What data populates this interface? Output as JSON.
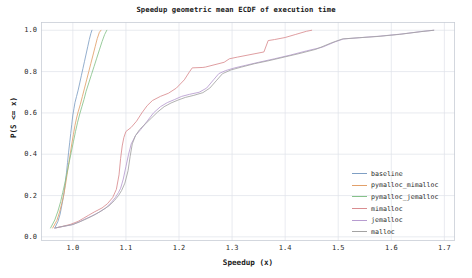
{
  "chart_data": {
    "type": "line",
    "title": "Speedup geometric mean ECDF of execution time",
    "xlabel": "Speedup (x)",
    "ylabel": "P(S <= x)",
    "xlim": [
      0.94,
      1.72
    ],
    "ylim": [
      -0.02,
      1.04
    ],
    "grid": true,
    "legend_position": "lower right",
    "xticks": [
      "1.0",
      "1.1",
      "1.2",
      "1.3",
      "1.4",
      "1.5",
      "1.6",
      "1.7"
    ],
    "xtick_values": [
      1.0,
      1.1,
      1.2,
      1.3,
      1.4,
      1.5,
      1.6,
      1.7
    ],
    "yticks": [
      "0.0",
      "0.2",
      "0.4",
      "0.6",
      "0.8",
      "1.0"
    ],
    "ytick_values": [
      0.0,
      0.2,
      0.4,
      0.6,
      0.8,
      1.0
    ],
    "series": [
      {
        "name": "baseline",
        "color": "#7f9fc4",
        "points": [
          [
            0.966,
            0.043
          ],
          [
            0.972,
            0.075
          ],
          [
            0.976,
            0.11
          ],
          [
            0.979,
            0.15
          ],
          [
            0.982,
            0.19
          ],
          [
            0.984,
            0.225
          ],
          [
            0.986,
            0.265
          ],
          [
            0.988,
            0.31
          ],
          [
            0.99,
            0.36
          ],
          [
            0.992,
            0.41
          ],
          [
            0.994,
            0.455
          ],
          [
            0.996,
            0.5
          ],
          [
            0.998,
            0.545
          ],
          [
            1.0,
            0.59
          ],
          [
            1.002,
            0.62
          ],
          [
            1.004,
            0.65
          ],
          [
            1.007,
            0.68
          ],
          [
            1.01,
            0.71
          ],
          [
            1.013,
            0.745
          ],
          [
            1.016,
            0.78
          ],
          [
            1.019,
            0.815
          ],
          [
            1.022,
            0.85
          ],
          [
            1.025,
            0.885
          ],
          [
            1.028,
            0.92
          ],
          [
            1.031,
            0.955
          ],
          [
            1.034,
            0.985
          ],
          [
            1.036,
            1.0
          ]
        ]
      },
      {
        "name": "pymalloc_mimalloc",
        "color": "#e2a06a",
        "points": [
          [
            0.962,
            0.043
          ],
          [
            0.97,
            0.08
          ],
          [
            0.975,
            0.12
          ],
          [
            0.979,
            0.16
          ],
          [
            0.983,
            0.205
          ],
          [
            0.986,
            0.25
          ],
          [
            0.989,
            0.3
          ],
          [
            0.992,
            0.35
          ],
          [
            0.995,
            0.4
          ],
          [
            0.998,
            0.45
          ],
          [
            1.001,
            0.495
          ],
          [
            1.004,
            0.54
          ],
          [
            1.007,
            0.575
          ],
          [
            1.01,
            0.605
          ],
          [
            1.014,
            0.64
          ],
          [
            1.018,
            0.68
          ],
          [
            1.022,
            0.72
          ],
          [
            1.026,
            0.76
          ],
          [
            1.03,
            0.8
          ],
          [
            1.034,
            0.84
          ],
          [
            1.038,
            0.88
          ],
          [
            1.042,
            0.92
          ],
          [
            1.046,
            0.96
          ],
          [
            1.05,
            0.99
          ],
          [
            1.053,
            1.0
          ]
        ]
      },
      {
        "name": "pymalloc_jemalloc",
        "color": "#86c28a",
        "points": [
          [
            0.958,
            0.043
          ],
          [
            0.966,
            0.082
          ],
          [
            0.972,
            0.125
          ],
          [
            0.977,
            0.17
          ],
          [
            0.981,
            0.215
          ],
          [
            0.985,
            0.26
          ],
          [
            0.989,
            0.31
          ],
          [
            0.993,
            0.36
          ],
          [
            0.997,
            0.41
          ],
          [
            1.001,
            0.46
          ],
          [
            1.005,
            0.51
          ],
          [
            1.009,
            0.555
          ],
          [
            1.013,
            0.595
          ],
          [
            1.017,
            0.63
          ],
          [
            1.021,
            0.665
          ],
          [
            1.025,
            0.705
          ],
          [
            1.03,
            0.745
          ],
          [
            1.035,
            0.785
          ],
          [
            1.04,
            0.825
          ],
          [
            1.045,
            0.865
          ],
          [
            1.05,
            0.905
          ],
          [
            1.055,
            0.945
          ],
          [
            1.06,
            0.98
          ],
          [
            1.064,
            1.0
          ]
        ]
      },
      {
        "name": "mimalloc",
        "color": "#d98d90",
        "points": [
          [
            0.968,
            0.043
          ],
          [
            0.995,
            0.06
          ],
          [
            1.01,
            0.075
          ],
          [
            1.02,
            0.09
          ],
          [
            1.03,
            0.105
          ],
          [
            1.04,
            0.12
          ],
          [
            1.055,
            0.14
          ],
          [
            1.065,
            0.16
          ],
          [
            1.075,
            0.19
          ],
          [
            1.082,
            0.23
          ],
          [
            1.087,
            0.3
          ],
          [
            1.09,
            0.38
          ],
          [
            1.093,
            0.44
          ],
          [
            1.096,
            0.48
          ],
          [
            1.1,
            0.51
          ],
          [
            1.11,
            0.53
          ],
          [
            1.12,
            0.56
          ],
          [
            1.13,
            0.6
          ],
          [
            1.14,
            0.635
          ],
          [
            1.15,
            0.66
          ],
          [
            1.165,
            0.68
          ],
          [
            1.18,
            0.695
          ],
          [
            1.195,
            0.72
          ],
          [
            1.21,
            0.76
          ],
          [
            1.22,
            0.8
          ],
          [
            1.225,
            0.818
          ],
          [
            1.245,
            0.82
          ],
          [
            1.25,
            0.822
          ],
          [
            1.285,
            0.845
          ],
          [
            1.295,
            0.862
          ],
          [
            1.31,
            0.87
          ],
          [
            1.33,
            0.88
          ],
          [
            1.36,
            0.895
          ],
          [
            1.368,
            0.95
          ],
          [
            1.38,
            0.955
          ],
          [
            1.4,
            0.965
          ],
          [
            1.42,
            0.98
          ],
          [
            1.44,
            0.995
          ],
          [
            1.45,
            1.0
          ]
        ]
      },
      {
        "name": "jemalloc",
        "color": "#b79cd0",
        "points": [
          [
            0.966,
            0.043
          ],
          [
            0.998,
            0.058
          ],
          [
            1.012,
            0.072
          ],
          [
            1.022,
            0.085
          ],
          [
            1.035,
            0.1
          ],
          [
            1.05,
            0.12
          ],
          [
            1.062,
            0.14
          ],
          [
            1.072,
            0.165
          ],
          [
            1.08,
            0.19
          ],
          [
            1.086,
            0.215
          ],
          [
            1.09,
            0.235
          ],
          [
            1.095,
            0.28
          ],
          [
            1.1,
            0.34
          ],
          [
            1.105,
            0.4
          ],
          [
            1.11,
            0.45
          ],
          [
            1.118,
            0.49
          ],
          [
            1.128,
            0.52
          ],
          [
            1.14,
            0.56
          ],
          [
            1.152,
            0.6
          ],
          [
            1.165,
            0.63
          ],
          [
            1.178,
            0.65
          ],
          [
            1.192,
            0.665
          ],
          [
            1.205,
            0.68
          ],
          [
            1.22,
            0.69
          ],
          [
            1.238,
            0.7
          ],
          [
            1.252,
            0.72
          ],
          [
            1.265,
            0.76
          ],
          [
            1.275,
            0.79
          ],
          [
            1.288,
            0.805
          ],
          [
            1.305,
            0.818
          ],
          [
            1.325,
            0.83
          ],
          [
            1.35,
            0.845
          ],
          [
            1.38,
            0.862
          ],
          [
            1.41,
            0.88
          ],
          [
            1.44,
            0.9
          ],
          [
            1.47,
            0.918
          ],
          [
            1.495,
            0.945
          ],
          [
            1.51,
            0.958
          ],
          [
            1.545,
            0.965
          ],
          [
            1.58,
            0.972
          ],
          [
            1.62,
            0.982
          ],
          [
            1.66,
            0.995
          ],
          [
            1.68,
            1.0
          ]
        ]
      },
      {
        "name": "malloc",
        "color": "#a3a3a3",
        "points": [
          [
            0.966,
            0.043
          ],
          [
            1.0,
            0.06
          ],
          [
            1.015,
            0.075
          ],
          [
            1.028,
            0.09
          ],
          [
            1.042,
            0.108
          ],
          [
            1.055,
            0.128
          ],
          [
            1.068,
            0.15
          ],
          [
            1.078,
            0.175
          ],
          [
            1.086,
            0.2
          ],
          [
            1.092,
            0.225
          ],
          [
            1.098,
            0.26
          ],
          [
            1.104,
            0.32
          ],
          [
            1.108,
            0.39
          ],
          [
            1.112,
            0.45
          ],
          [
            1.118,
            0.49
          ],
          [
            1.126,
            0.52
          ],
          [
            1.136,
            0.545
          ],
          [
            1.148,
            0.575
          ],
          [
            1.16,
            0.605
          ],
          [
            1.172,
            0.63
          ],
          [
            1.185,
            0.648
          ],
          [
            1.198,
            0.662
          ],
          [
            1.212,
            0.675
          ],
          [
            1.228,
            0.685
          ],
          [
            1.245,
            0.698
          ],
          [
            1.258,
            0.72
          ],
          [
            1.27,
            0.755
          ],
          [
            1.282,
            0.79
          ],
          [
            1.298,
            0.808
          ],
          [
            1.318,
            0.822
          ],
          [
            1.342,
            0.838
          ],
          [
            1.368,
            0.852
          ],
          [
            1.398,
            0.87
          ],
          [
            1.428,
            0.888
          ],
          [
            1.458,
            0.908
          ],
          [
            1.488,
            0.94
          ],
          [
            1.508,
            0.958
          ],
          [
            1.54,
            0.964
          ],
          [
            1.575,
            0.97
          ],
          [
            1.615,
            0.98
          ],
          [
            1.655,
            0.993
          ],
          [
            1.68,
            1.0
          ]
        ]
      }
    ]
  },
  "legend": {
    "items": [
      {
        "label": "baseline"
      },
      {
        "label": "pymalloc_mimalloc"
      },
      {
        "label": "pymalloc_jemalloc"
      },
      {
        "label": "mimalloc"
      },
      {
        "label": "jemalloc"
      },
      {
        "label": "malloc"
      }
    ]
  }
}
